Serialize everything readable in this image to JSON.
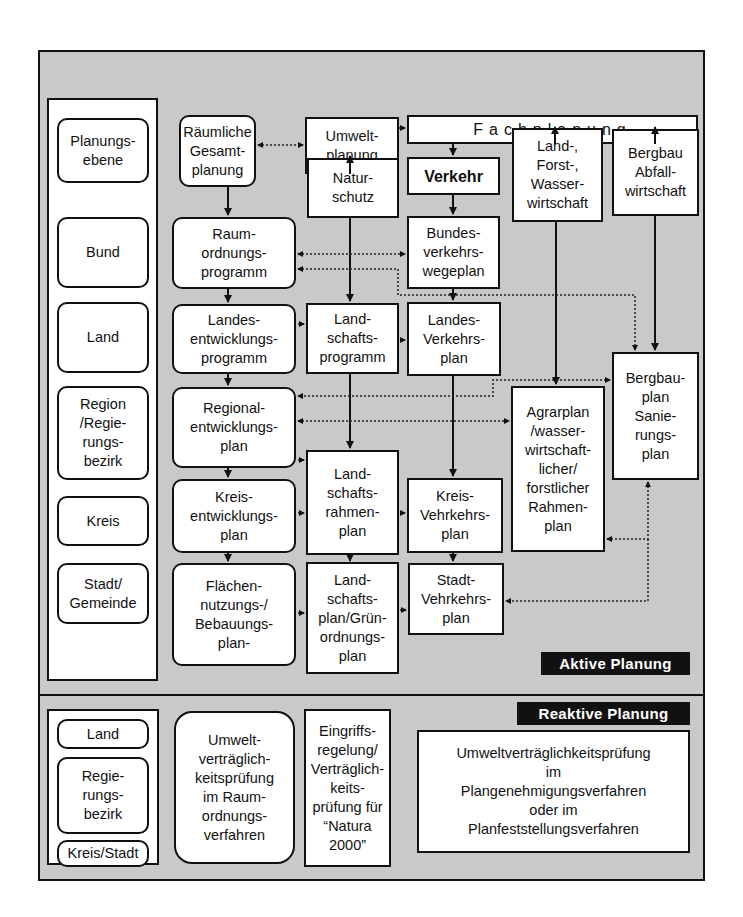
{
  "active_panel": {
    "label": "Aktive Planung",
    "levels": {
      "header": "Planungs-\nebene",
      "items": [
        "Bund",
        "Land",
        "Region\n/Regie-\nrungs-\nbezirk",
        "Kreis",
        "Stadt/\nGemeinde"
      ]
    },
    "gesamtplanung": {
      "header": "Räumliche\nGesamt-\nplanung",
      "items": [
        "Raum-\nordnungs-\nprogramm",
        "Landes-\nentwicklungs-\nprogramm",
        "Regional-\nentwicklungs-\nplan",
        "Kreis-\nentwicklungs-\nplan",
        "Flächen-\nnutzungs-/\nBebauungs-\nplan-"
      ]
    },
    "umweltplanung": {
      "header": "Umwelt-\nplanung",
      "naturschutz": "Natur-\nschutz",
      "items": [
        "Land-\nschafts-\nprogramm",
        "Land-\nschafts-\nrahmen-\nplan",
        "Land-\nschafts-\nplan/Grün-\nordnungs-\nplan"
      ]
    },
    "fachplanung": {
      "header": "Fachplanung",
      "verkehr": {
        "header": "Verkehr",
        "items": [
          "Bundes-\nverkehrs-\nwegeplan",
          "Landes-\nVerkehrs-\nplan",
          "Kreis-\nVehrkehrs-\nplan",
          "Stadt-\nVehrkehrs-\nplan"
        ]
      },
      "landforst": {
        "header": "Land-,\nForst-,\nWasser-\nwirtschaft",
        "plan": "Agrarplan\n/wasser-\nwirtschaft-\nlicher/\nforstlicher\nRahmen-\nplan"
      },
      "bergbau": {
        "header": "Bergbau\nAbfall-\nwirtschaft",
        "plan": "Bergbau-\nplan\nSanie-\nrungs-\nplan"
      }
    }
  },
  "reactive_panel": {
    "label": "Reaktive Planung",
    "levels": [
      "Land",
      "Regie-\nrungs-\nbezirk",
      "Kreis/Stadt"
    ],
    "uvp_raumordnung": "Umwelt-\nverträglich-\nkeitsprüfung\nim Raum-\nordnungs-\nverfahren",
    "eingriffsregelung": "Eingriffs-\nregelung/\nVerträglich-\nkeits-\nprüfung für\n“Natura\n2000”",
    "uvp_plan": "Umweltverträglichkeitsprüfung\nim\nPlangenehmigungsverfahren\noder im\nPlanfeststellungsverfahren"
  },
  "colors": {
    "panel_bg": "#c9c9c9",
    "box_bg": "#ffffff",
    "border": "#111111",
    "label_bg": "#111111",
    "label_text": "#ffffff"
  }
}
